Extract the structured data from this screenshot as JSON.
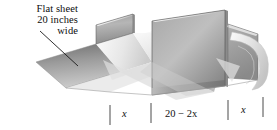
{
  "figure": {
    "caption": {
      "line1": "Flat sheet",
      "line2": "20 inches",
      "line3": "wide"
    },
    "dimensions": {
      "left_flap": "x",
      "base": "20 − 2x",
      "right_flap": "x"
    },
    "colors": {
      "outline": "#1a1a1a",
      "metal_light": "#f1f1f1",
      "metal_mid": "#bdbdbd",
      "metal_dark": "#8f8f8f",
      "metal_shadow": "#6e6e6e",
      "background": "#ffffff",
      "text": "#0d0d0d"
    },
    "leader_line": {
      "from_x": 40,
      "from_y": 31,
      "to_x": 78,
      "to_y": 66
    },
    "tick_marks": [
      {
        "x": 110,
        "y1": 105,
        "y2": 125
      },
      {
        "x": 151,
        "y1": 103,
        "y2": 123
      },
      {
        "x": 228,
        "y1": 100,
        "y2": 120
      },
      {
        "x": 263,
        "y1": 98,
        "y2": 118
      }
    ]
  }
}
